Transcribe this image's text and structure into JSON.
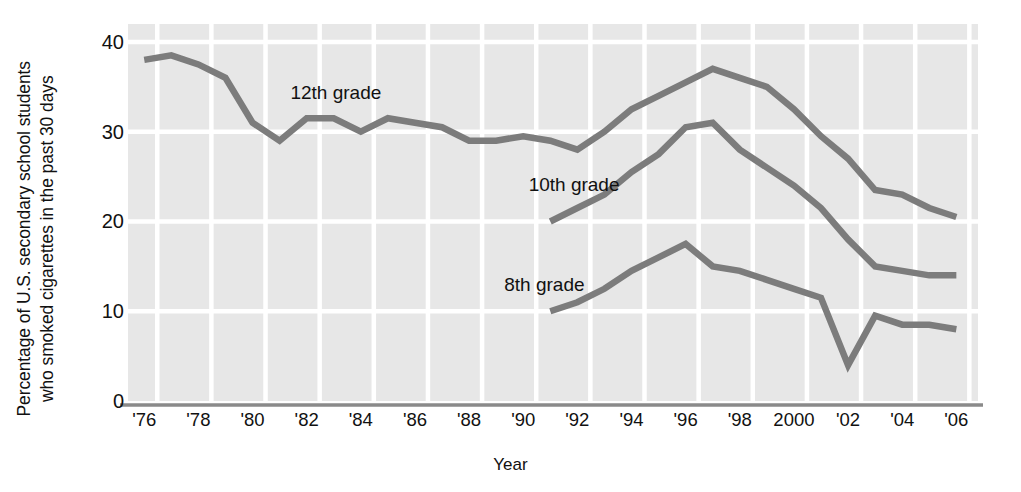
{
  "chart_data": {
    "type": "line",
    "title": "",
    "ylabel": "Percentage of U.S. secondary school students\nwho smoked cigarettes in the past 30 days",
    "xlabel": "Year",
    "ylim": [
      0,
      42
    ],
    "xlim": [
      1975.4,
      2006.8
    ],
    "yticks": [
      0,
      10,
      20,
      30,
      40
    ],
    "ytick_labels": [
      "0",
      "10",
      "20",
      "30",
      "40"
    ],
    "xticks": [
      1976,
      1978,
      1980,
      1982,
      1984,
      1986,
      1988,
      1990,
      1992,
      1994,
      1996,
      1998,
      2000,
      2002,
      2004,
      2006
    ],
    "xtick_labels": [
      "'76",
      "'78",
      "'80",
      "'82",
      "'84",
      "'86",
      "'88",
      "'90",
      "'92",
      "'94",
      "'96",
      "'98",
      "2000",
      "'02",
      "'04",
      "'06"
    ],
    "grid": true,
    "grid_color": "#ffffff",
    "plot_bg": "#e7e7e7",
    "line_color": "#7c7c7c",
    "legend_position": "inline-annotations",
    "series": [
      {
        "name": "12th grade",
        "label_x": 1981.4,
        "label_y": 34.2,
        "x": [
          1976,
          1977,
          1978,
          1979,
          1980,
          1981,
          1982,
          1983,
          1984,
          1985,
          1986,
          1987,
          1988,
          1989,
          1990,
          1991,
          1992,
          1993,
          1994,
          1995,
          1996,
          1997,
          1998,
          1999,
          2000,
          2001,
          2002,
          2003,
          2004,
          2005,
          2006
        ],
        "values": [
          38.0,
          38.5,
          37.5,
          36.0,
          31.0,
          29.0,
          31.5,
          31.5,
          30.0,
          31.5,
          31.0,
          30.5,
          29.0,
          29.0,
          29.5,
          29.0,
          28.0,
          30.0,
          32.5,
          34.0,
          35.5,
          37.0,
          36.0,
          35.0,
          32.5,
          29.5,
          27.0,
          23.5,
          23.0,
          21.5,
          20.5
        ]
      },
      {
        "name": "10th grade",
        "label_x": 1990.2,
        "label_y": 24.0,
        "x": [
          1991,
          1992,
          1993,
          1994,
          1995,
          1996,
          1997,
          1998,
          1999,
          2000,
          2001,
          2002,
          2003,
          2004,
          2005,
          2006
        ],
        "values": [
          20.0,
          21.5,
          23.0,
          25.5,
          27.5,
          30.5,
          31.0,
          28.0,
          26.0,
          24.0,
          21.5,
          18.0,
          15.0,
          14.5,
          14.0,
          14.0
        ]
      },
      {
        "name": "8th grade",
        "label_x": 1989.3,
        "label_y": 12.8,
        "x": [
          1991,
          1992,
          1993,
          1994,
          1995,
          1996,
          1997,
          1998,
          1999,
          2000,
          2001,
          2002,
          2003,
          2004,
          2005,
          2006
        ],
        "values": [
          10.0,
          11.0,
          12.5,
          14.5,
          16.0,
          17.5,
          15.0,
          14.5,
          13.5,
          12.5,
          11.5,
          4.0,
          9.5,
          8.5,
          8.5,
          8.0
        ]
      }
    ]
  },
  "axis": {
    "ylabel_text": "Percentage of U.S. secondary school students\nwho smoked cigarettes in the past 30 days",
    "xlabel_text": "Year"
  }
}
